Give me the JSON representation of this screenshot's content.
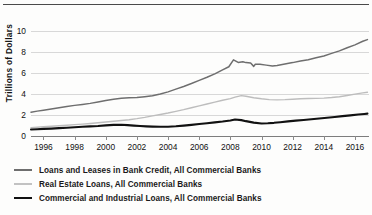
{
  "chart_data": {
    "type": "line",
    "title": "",
    "xlabel": "",
    "ylabel": "Trillions of Dollars",
    "xlim": [
      1995.2,
      2016.9
    ],
    "ylim": [
      0,
      11
    ],
    "yticks": [
      0,
      2,
      4,
      6,
      8,
      10
    ],
    "ytick_labels": [
      "0",
      "2",
      "4",
      "6",
      "8",
      "10"
    ],
    "xticks": [
      1996,
      1998,
      2000,
      2002,
      2004,
      2006,
      2008,
      2010,
      2012,
      2014,
      2016
    ],
    "xtick_labels": [
      "1996",
      "1998",
      "2000",
      "2002",
      "2004",
      "2006",
      "2008",
      "2010",
      "2012",
      "2014",
      "2016"
    ],
    "grid": true,
    "grid_axis": "y",
    "legend_position": "below",
    "colors": {
      "loans_and_leases": "#6e6e6e",
      "real_estate": "#bdbdbd",
      "commercial_industrial": "#111111",
      "gridline": "#d8d8d8",
      "axis": "#7d7d7d",
      "text": "#1a1a1a"
    },
    "series": [
      {
        "name": "Loans and Leases in Bank Credit, All Commercial Banks",
        "color": "#6e6e6e",
        "width": 1.5,
        "x": [
          1995.2,
          1995.6,
          1996.0,
          1996.5,
          1997.0,
          1997.5,
          1998.0,
          1998.5,
          1999.0,
          1999.5,
          2000.0,
          2000.5,
          2001.0,
          2001.5,
          2002.0,
          2002.5,
          2003.0,
          2003.5,
          2004.0,
          2004.5,
          2005.0,
          2005.5,
          2006.0,
          2006.5,
          2007.0,
          2007.5,
          2007.9,
          2008.2,
          2008.5,
          2008.8,
          2009.0,
          2009.3,
          2009.5,
          2009.6,
          2009.9,
          2010.3,
          2010.7,
          2011.0,
          2011.5,
          2012.0,
          2012.5,
          2013.0,
          2013.5,
          2014.0,
          2014.5,
          2015.0,
          2015.5,
          2016.0,
          2016.5,
          2016.8
        ],
        "y": [
          2.28,
          2.38,
          2.47,
          2.58,
          2.7,
          2.82,
          2.93,
          3.02,
          3.12,
          3.26,
          3.4,
          3.52,
          3.62,
          3.66,
          3.69,
          3.76,
          3.84,
          4.02,
          4.22,
          4.48,
          4.74,
          5.02,
          5.32,
          5.62,
          5.94,
          6.32,
          6.62,
          7.28,
          7.04,
          7.1,
          7.02,
          6.98,
          6.66,
          6.86,
          6.86,
          6.78,
          6.7,
          6.74,
          6.88,
          7.02,
          7.18,
          7.3,
          7.48,
          7.66,
          7.9,
          8.14,
          8.44,
          8.72,
          9.06,
          9.22
        ]
      },
      {
        "name": "Real Estate Loans, All Commercial Banks",
        "color": "#bdbdbd",
        "width": 1.4,
        "x": [
          1995.2,
          1995.6,
          1996.0,
          1996.5,
          1997.0,
          1997.5,
          1998.0,
          1998.5,
          1999.0,
          1999.5,
          2000.0,
          2000.5,
          2001.0,
          2001.5,
          2002.0,
          2002.5,
          2003.0,
          2003.5,
          2004.0,
          2004.5,
          2005.0,
          2005.5,
          2006.0,
          2006.5,
          2007.0,
          2007.5,
          2008.0,
          2008.3,
          2008.7,
          2009.0,
          2009.5,
          2010.0,
          2010.5,
          2011.0,
          2011.5,
          2012.0,
          2012.5,
          2013.0,
          2013.5,
          2014.0,
          2014.5,
          2015.0,
          2015.5,
          2016.0,
          2016.5,
          2016.8
        ],
        "y": [
          0.8,
          0.84,
          0.88,
          0.93,
          0.98,
          1.03,
          1.09,
          1.14,
          1.2,
          1.27,
          1.34,
          1.41,
          1.48,
          1.56,
          1.66,
          1.78,
          1.92,
          2.06,
          2.2,
          2.36,
          2.52,
          2.7,
          2.88,
          3.06,
          3.24,
          3.42,
          3.58,
          3.72,
          3.86,
          3.8,
          3.66,
          3.56,
          3.48,
          3.46,
          3.48,
          3.52,
          3.56,
          3.58,
          3.6,
          3.62,
          3.68,
          3.76,
          3.88,
          4.0,
          4.12,
          4.18
        ]
      },
      {
        "name": "Commercial and Industrial Loans, All Commercial Banks",
        "color": "#111111",
        "width": 2.1,
        "x": [
          1995.2,
          1995.6,
          1996.0,
          1996.5,
          1997.0,
          1997.5,
          1998.0,
          1998.5,
          1999.0,
          1999.5,
          2000.0,
          2000.5,
          2001.0,
          2001.4,
          2001.8,
          2002.2,
          2002.6,
          2003.0,
          2003.5,
          2004.0,
          2004.5,
          2005.0,
          2005.5,
          2006.0,
          2006.5,
          2007.0,
          2007.5,
          2008.0,
          2008.3,
          2008.7,
          2009.0,
          2009.5,
          2010.0,
          2010.4,
          2010.8,
          2011.2,
          2011.7,
          2012.2,
          2012.7,
          2013.2,
          2013.7,
          2014.2,
          2014.7,
          2015.2,
          2015.7,
          2016.2,
          2016.6,
          2016.8
        ],
        "y": [
          0.62,
          0.65,
          0.68,
          0.71,
          0.75,
          0.79,
          0.84,
          0.88,
          0.92,
          0.96,
          1.02,
          1.06,
          1.08,
          1.04,
          0.99,
          0.95,
          0.92,
          0.9,
          0.88,
          0.89,
          0.93,
          0.99,
          1.06,
          1.14,
          1.22,
          1.3,
          1.38,
          1.48,
          1.58,
          1.52,
          1.42,
          1.28,
          1.2,
          1.22,
          1.26,
          1.32,
          1.4,
          1.47,
          1.53,
          1.6,
          1.67,
          1.74,
          1.82,
          1.9,
          1.97,
          2.05,
          2.11,
          2.14
        ]
      }
    ]
  },
  "legend": {
    "items": [
      {
        "label": "Loans and Leases in Bank Credit, All Commercial Banks",
        "color": "#6e6e6e",
        "thickness": "1.6px"
      },
      {
        "label": "Real Estate Loans, All Commercial Banks",
        "color": "#c2c2c2",
        "thickness": "1.3px"
      },
      {
        "label": "Commercial and Industrial Loans, All Commercial Banks",
        "color": "#111111",
        "thickness": "2.4px"
      }
    ]
  }
}
